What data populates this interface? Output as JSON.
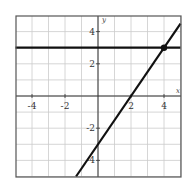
{
  "chart_data": {
    "type": "line",
    "title": "",
    "xlabel": "x",
    "ylabel": "y",
    "xlim": [
      -5,
      5
    ],
    "ylim": [
      -5,
      5
    ],
    "grid": true,
    "x_ticks": [
      -4,
      -2,
      2,
      4
    ],
    "y_ticks": [
      4,
      2,
      -2,
      -4
    ],
    "x_tick_labels": [
      "-4",
      "-2",
      "2",
      "4"
    ],
    "y_tick_labels": [
      "4",
      "2",
      "-2",
      "-4"
    ],
    "series": [
      {
        "name": "y = 3",
        "equation": "y = 3",
        "x": [
          -5,
          5
        ],
        "y": [
          3,
          3
        ]
      },
      {
        "name": "y = 1.5x - 3",
        "equation": "y = 1.5x - 3",
        "x": [
          -1.33,
          5
        ],
        "y": [
          -5,
          4.5
        ]
      }
    ],
    "points": [
      {
        "label": "intersection",
        "x": 4,
        "y": 3
      }
    ],
    "colors": {
      "line": "#111111",
      "grid": "#cccccc",
      "axis": "#333333"
    }
  }
}
